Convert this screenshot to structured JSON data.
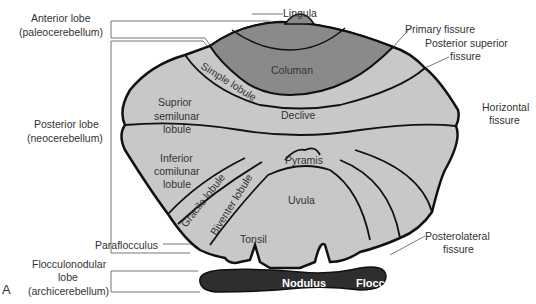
{
  "figure_letter": "A",
  "left_labels": {
    "anterior": [
      "Anterior lobe",
      "(paleocerebellum)"
    ],
    "posterior": [
      "Posterior lobe",
      "(neocerebellum)"
    ],
    "flocculonodular": [
      "Flocculonodular",
      "lobe",
      "(archicerebellum)"
    ],
    "paraflocculus": "Paraflocculus"
  },
  "right_labels": {
    "lingula": "Lingula",
    "primary_fissure": "Primary fissure",
    "posterior_superior_fissure": [
      "Posterior superior",
      "fissure"
    ],
    "horizontal_fissure": [
      "Horizontal",
      "fissure"
    ],
    "posterolateral_fissure": [
      "Posterolateral",
      "fissure"
    ]
  },
  "regions": {
    "columan": "Columan",
    "simple_lobule": "Simple lobule",
    "superior_semilunar": [
      "Suprior",
      "semilunar",
      "lobule"
    ],
    "declive": "Declive",
    "inferior_semilunar": [
      "Inferior",
      "comilunar",
      "lobule"
    ],
    "pyramis": "Pyramis",
    "gracile": "Gracile lobule",
    "biventer": "Biventer lobule",
    "uvula": "Uvula",
    "tonsil": "Tonsil",
    "nodulus": "Nodulus",
    "flocculus": "Flocculus"
  },
  "colors": {
    "light_gray": "#c8c8c8",
    "dark_gray": "#8a8a8a",
    "black_lobe": "#2e2e2e",
    "outline": "#111111",
    "text": "#333333"
  }
}
